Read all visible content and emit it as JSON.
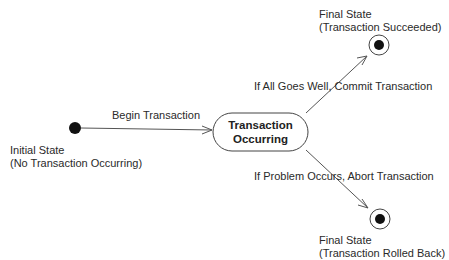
{
  "diagram": {
    "type": "uml-state-diagram",
    "initial_state": {
      "label_line1": "Initial State",
      "label_line2": "(No Transaction Occurring)"
    },
    "state": {
      "line1": "Transaction",
      "line2": "Occurring"
    },
    "final_success": {
      "label_line1": "Final State",
      "label_line2": "(Transaction Succeeded)"
    },
    "final_rollback": {
      "label_line1": "Final State",
      "label_line2": "(Transaction Rolled Back)"
    },
    "transitions": {
      "begin": "Begin Transaction",
      "commit": "If All Goes Well, Commit Transaction",
      "abort": "If Problem Occurs, Abort Transaction"
    }
  }
}
